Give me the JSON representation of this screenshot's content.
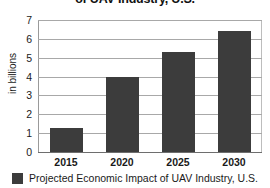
{
  "chart_data": {
    "type": "bar",
    "title": "of UAV Industry, U.S.",
    "xlabel": "",
    "ylabel": "in billions",
    "categories": [
      "2015",
      "2020",
      "2025",
      "2030"
    ],
    "values": [
      1.3,
      4.0,
      5.3,
      6.4
    ],
    "series": [
      {
        "name": "Projected Economic Impact of UAV Industry, U.S.",
        "values": [
          1.3,
          4.0,
          5.3,
          6.4
        ],
        "color": "#3c3c3c"
      }
    ],
    "ylim": [
      0,
      7
    ],
    "ytick_labels": [
      "7",
      "6",
      "5",
      "4",
      "3",
      "2",
      "1",
      "0"
    ],
    "ytick_values": [
      7,
      6,
      5,
      4,
      3,
      2,
      1,
      0
    ],
    "grid": true,
    "legend_position": "bottom",
    "legend_entries": [
      "Projected Economic Impact of UAV Industry, U.S."
    ]
  },
  "legend": {
    "entry_label": "Projected Economic Impact of UAV Industry, U.S.",
    "swatch_color": "#3c3c3c"
  }
}
